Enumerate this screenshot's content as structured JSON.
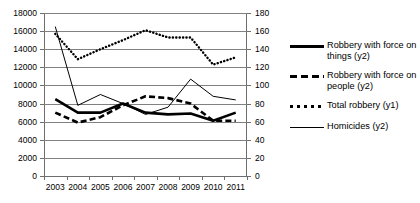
{
  "chart_data": {
    "type": "line",
    "title": "",
    "xlabel": "",
    "ylabel": "",
    "grid": true,
    "legend_position": "right",
    "categories": [
      "2003",
      "2004",
      "2005",
      "2006",
      "2007",
      "2008",
      "2009",
      "2010",
      "2011"
    ],
    "axes": {
      "left": {
        "label": "y1",
        "ylim": [
          0,
          18000
        ],
        "step": 2000,
        "ticks": [
          "0",
          "2000",
          "4000",
          "6000",
          "8000",
          "10000",
          "12000",
          "14000",
          "16000",
          "18000"
        ]
      },
      "right": {
        "label": "y2",
        "ylim": [
          0,
          180
        ],
        "step": 20,
        "ticks": [
          "0",
          "20",
          "40",
          "60",
          "80",
          "100",
          "120",
          "140",
          "160",
          "180"
        ]
      }
    },
    "series": [
      {
        "name": "Robbery with force on things (y2)",
        "legend_label_line1": "Robbery with force on",
        "legend_label_line2": "things (y2)",
        "axis": "right",
        "style": "solid-thick",
        "color": "#000000",
        "values": [
          85,
          70,
          70,
          80,
          70,
          68,
          69,
          61,
          70
        ],
        "values_left_scale": [
          8500,
          7000,
          7000,
          8000,
          7000,
          6800,
          6900,
          6100,
          7000
        ]
      },
      {
        "name": "Robbery with force on people (y2)",
        "legend_label_line1": "Robbery with force on",
        "legend_label_line2": "people (y2)",
        "axis": "right",
        "style": "dashed-thick",
        "color": "#000000",
        "values": [
          70,
          59,
          65,
          78,
          88,
          86,
          80,
          61,
          61
        ],
        "values_left_scale": [
          7000,
          5900,
          6500,
          7800,
          8800,
          8600,
          8000,
          6100,
          6100
        ]
      },
      {
        "name": "Total robbery (y1)",
        "legend_label_line1": "Total robbery (y1)",
        "legend_label_line2": "",
        "axis": "left",
        "style": "dotted",
        "color": "#000000",
        "values": [
          15700,
          12900,
          14000,
          15000,
          16100,
          15300,
          15300,
          12300,
          13100
        ]
      },
      {
        "name": "Homicides (y2)",
        "legend_label_line1": "Homicides (y2)",
        "legend_label_line2": "",
        "axis": "right",
        "style": "solid-thin",
        "color": "#000000",
        "values": [
          165,
          78,
          90,
          80,
          68,
          76,
          107,
          88,
          84
        ],
        "values_left_scale": [
          16500,
          7800,
          9000,
          8000,
          6800,
          7600,
          10700,
          8800,
          8400
        ]
      }
    ]
  }
}
